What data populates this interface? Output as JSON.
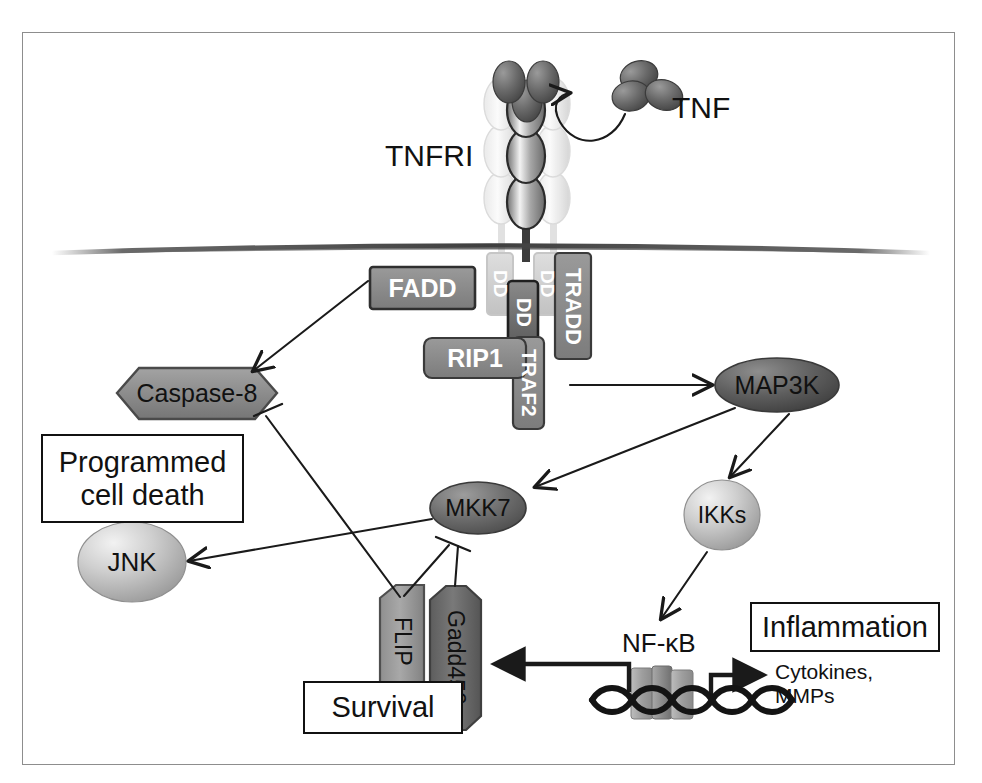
{
  "figure": {
    "background": "#ffffff",
    "border_color": "#8d8d8d"
  },
  "palette": {
    "chip_gray": "#8a8a8a",
    "chip_dark": "#6f6f6f",
    "chip_border": "#2a2a2a",
    "hex_gray": "#8c8c8c",
    "ellipse_dark": "#5f5f5f",
    "sphere_light": "#c9c9c9",
    "ghost": "#d8d8d8",
    "line": "#1a1a1a",
    "membrane": "#5a5a5a",
    "text_white": "#ffffff",
    "text_black": "#111111"
  },
  "ligand": {
    "label": "TNF",
    "subunits": 3,
    "color": "#5c5c5c"
  },
  "receptor": {
    "label": "TNFRI",
    "chains": 3,
    "domains_per_chain": 4,
    "center_chain_color": "#9a9a9a",
    "side_chain_color": "#e2e2e2"
  },
  "membrane": {
    "name": "plasma-membrane",
    "color": "#5a5a5a"
  },
  "adaptors": [
    {
      "id": "fadd",
      "label": "FADD",
      "shape": "rounded-rect",
      "fill": "#8a8a8a",
      "text": "#ffffff"
    },
    {
      "id": "dd1",
      "label": "DD",
      "shape": "rounded-rect",
      "fill": "#c4c4c4",
      "text": "#ffffff",
      "ghost": true
    },
    {
      "id": "dd2",
      "label": "DD",
      "shape": "rounded-rect",
      "fill": "#7a7a7a",
      "text": "#ffffff",
      "ghost": false
    },
    {
      "id": "dd3",
      "label": "DD",
      "shape": "rounded-rect",
      "fill": "#c4c4c4",
      "text": "#ffffff",
      "ghost": true
    },
    {
      "id": "tradd",
      "label": "TRADD",
      "shape": "rounded-rect",
      "fill": "#8a8a8a",
      "text": "#ffffff"
    },
    {
      "id": "rip1",
      "label": "RIP1",
      "shape": "rounded-rect",
      "fill": "#8a8a8a",
      "text": "#ffffff"
    },
    {
      "id": "traf2",
      "label": "TRAF2",
      "shape": "rounded-rect",
      "fill": "#8a8a8a",
      "text": "#ffffff"
    }
  ],
  "nodes": [
    {
      "id": "caspase8",
      "label": "Caspase-8",
      "shape": "hexagon",
      "fill": "#8c8c8c",
      "text": "#111111"
    },
    {
      "id": "map3k",
      "label": "MAP3K",
      "shape": "ellipse",
      "fill": "#5f5f5f",
      "text": "#111111"
    },
    {
      "id": "mkk7",
      "label": "MKK7",
      "shape": "ellipse",
      "fill": "#6d6d6d",
      "text": "#111111"
    },
    {
      "id": "ikks",
      "label": "IKKs",
      "shape": "sphere",
      "fill": "#c9c9c9",
      "text": "#111111"
    },
    {
      "id": "jnk",
      "label": "JNK",
      "shape": "sphere",
      "fill": "#c9c9c9",
      "text": "#111111"
    },
    {
      "id": "flip",
      "label": "FLIP",
      "shape": "v-hexagon",
      "fill": "#9a9a9a",
      "text": "#111111"
    },
    {
      "id": "gadd45b",
      "label": "Gadd45β",
      "shape": "v-hexagon",
      "fill": "#6f6f6f",
      "text": "#111111"
    }
  ],
  "outcome_boxes": [
    {
      "id": "pcd",
      "label": "Programmed\ncell death"
    },
    {
      "id": "survival",
      "label": "Survival"
    },
    {
      "id": "inflammation",
      "label": "Inflammation"
    }
  ],
  "dna": {
    "name": "dna-double-helix",
    "nfkb_label": "NF-κB",
    "nfkb_subunits": 3,
    "output_label": "Cytokines,\nMMPs"
  },
  "edges": [
    {
      "from": "TNF",
      "to": "TNFRI",
      "type": "curved-arrow"
    },
    {
      "from": "FADD",
      "to": "Caspase-8",
      "type": "arrow"
    },
    {
      "from": "TRAF2",
      "to": "MAP3K",
      "type": "arrow"
    },
    {
      "from": "MAP3K",
      "to": "MKK7",
      "type": "arrow"
    },
    {
      "from": "MAP3K",
      "to": "IKKs",
      "type": "arrow"
    },
    {
      "from": "MKK7",
      "to": "JNK",
      "type": "arrow"
    },
    {
      "from": "IKKs",
      "to": "NF-κB",
      "type": "arrow"
    },
    {
      "from": "FLIP",
      "to": "Caspase-8",
      "type": "inhibition"
    },
    {
      "from": "FLIP",
      "to": "MKK7",
      "type": "inhibition"
    },
    {
      "from": "Gadd45β",
      "to": "MKK7",
      "type": "inhibition"
    },
    {
      "from": "DNA",
      "to": "Gadd45β",
      "type": "thick-arrow"
    },
    {
      "from": "DNA",
      "to": "Cytokines, MMPs",
      "type": "thick-arrow"
    }
  ]
}
